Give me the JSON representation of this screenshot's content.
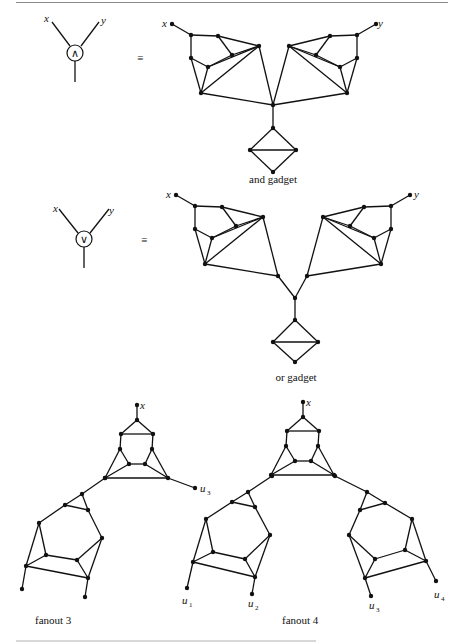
{
  "figure": {
    "and_symbol": {
      "inputs": [
        "x",
        "y"
      ],
      "operator": "∧",
      "equals": "≡"
    },
    "or_symbol": {
      "inputs": [
        "x",
        "y"
      ],
      "operator": "∨",
      "equals": "≡"
    },
    "and_gadget": {
      "caption": "and gadget",
      "terminals": [
        "x",
        "y"
      ]
    },
    "or_gadget": {
      "caption": "or gadget",
      "terminals": [
        "x",
        "y"
      ]
    },
    "fanout_3": {
      "caption": "fanout 3",
      "input": "x",
      "outputs": [
        "u",
        "u"
      ],
      "output_subscripts": [
        "3"
      ]
    },
    "fanout_4": {
      "caption": "fanout 4",
      "input": "x",
      "outputs": [
        "u",
        "u",
        "u",
        "u"
      ],
      "output_subscripts": [
        "1",
        "2",
        "3",
        "4"
      ]
    }
  },
  "colors": {
    "ink": "#111111",
    "rule": "#8a8a8a",
    "background": "#ffffff"
  }
}
